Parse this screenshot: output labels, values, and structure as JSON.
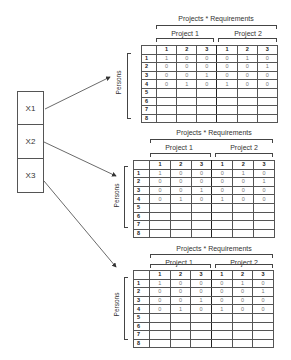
{
  "sources": [
    {
      "label": "X1"
    },
    {
      "label": "X2"
    },
    {
      "label": "X3"
    }
  ],
  "colors": {
    "line": "#555555",
    "text": "#333333",
    "background": "#ffffff"
  },
  "matrix": {
    "title": "Projects * Requirements",
    "projects": [
      "Project 1",
      "Project 2"
    ],
    "requirement_headers": [
      "1",
      "2",
      "3",
      "1",
      "2",
      "3"
    ],
    "row_axis_label": "Persons",
    "row_labels": [
      "1",
      "2",
      "3",
      "4",
      "5",
      "6",
      "7",
      "8"
    ],
    "rows": [
      [
        "1",
        "0",
        "0",
        "0",
        "1",
        "0"
      ],
      [
        "0",
        "0",
        "0",
        "0",
        "0",
        "1"
      ],
      [
        "0",
        "0",
        "1",
        "0",
        "0",
        "0"
      ],
      [
        "0",
        "1",
        "0",
        "1",
        "0",
        "0"
      ],
      [
        "",
        "",
        "",
        "",
        "",
        ""
      ],
      [
        "",
        "",
        "",
        "",
        "",
        ""
      ],
      [
        "",
        "",
        "",
        "",
        "",
        ""
      ],
      [
        "",
        "",
        "",
        "",
        "",
        ""
      ]
    ]
  }
}
